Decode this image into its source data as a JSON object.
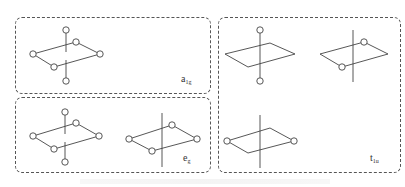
{
  "figure": {
    "panels": [
      {
        "id": "a1g",
        "label_main": "a",
        "label_sub": "1g"
      },
      {
        "id": "eg",
        "label_main": "e",
        "label_sub": "g"
      },
      {
        "id": "t1u",
        "label_main": "t",
        "label_sub": "1u"
      }
    ],
    "caption": ""
  },
  "style": {
    "line_color": "#444444",
    "border_color": "#555555",
    "background": "#ffffff"
  }
}
